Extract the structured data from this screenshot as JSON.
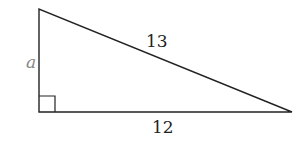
{
  "diagram": {
    "type": "right-triangle",
    "labels": {
      "vertical_leg": "a",
      "hypotenuse": "13",
      "horizontal_leg": "12"
    },
    "right_angle_marker": true,
    "colors": {
      "stroke": "#222222",
      "leg_label_a": "#888888",
      "background": "#ffffff"
    }
  }
}
